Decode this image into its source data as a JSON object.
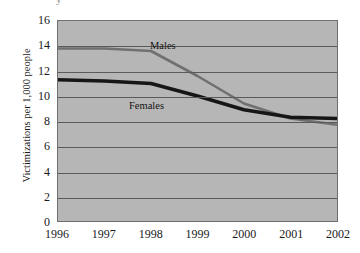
{
  "top_clip_text": "y",
  "chart_data": {
    "type": "line",
    "title": "",
    "xlabel": "",
    "ylabel": "Victimizations per 1,000 people",
    "x": [
      "1996",
      "1997",
      "1998",
      "1999",
      "2000",
      "2001",
      "2002"
    ],
    "xlim": [
      1996,
      2002
    ],
    "ylim": [
      0,
      16
    ],
    "y_ticks": [
      "0",
      "2",
      "4",
      "6",
      "8",
      "10",
      "12",
      "14",
      "16"
    ],
    "y_tick_values": [
      0,
      2,
      4,
      6,
      8,
      10,
      12,
      14,
      16
    ],
    "grid": true,
    "legend": "inline-annotations",
    "plot_background": "#b6b6b6",
    "series": [
      {
        "name": "Males",
        "color": "#707070",
        "line_width": 2.6,
        "values": [
          13.8,
          13.8,
          13.6,
          11.6,
          9.4,
          8.2,
          7.7
        ]
      },
      {
        "name": "Females",
        "color": "#161616",
        "line_width": 3.4,
        "values": [
          11.3,
          11.2,
          11.0,
          10.0,
          8.9,
          8.3,
          8.2
        ]
      }
    ],
    "annotations": [
      {
        "text": "Males",
        "x": "1998",
        "y": 14.6
      },
      {
        "text": "Females",
        "x": "1997",
        "y": 9.5
      }
    ]
  }
}
